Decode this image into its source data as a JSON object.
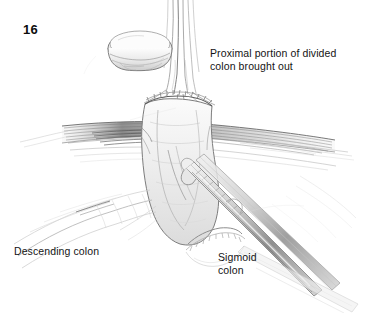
{
  "figure": {
    "number": "16",
    "background_color": "#ffffff",
    "ink_color": "#555555",
    "text_color": "#141414",
    "width": 390,
    "height": 313,
    "medium": "pencil illustration"
  },
  "labels": {
    "proximal": "Proximal portion of divided\ncolon brought out",
    "descending": "Descending colon",
    "sigmoid": "Sigmoid\ncolon"
  },
  "icons": {
    "divided_colon_stump": "divided-colon-stump",
    "bowel_loop": "exteriorized-bowel-loop",
    "abdominal_wall": "abdominal-wall-incision",
    "clamp": "surgical-clamp",
    "stapled_end": "stapled-bowel-end",
    "mesentery": "mesentery-traction",
    "retracted_tissue": "retracted-tissue"
  }
}
